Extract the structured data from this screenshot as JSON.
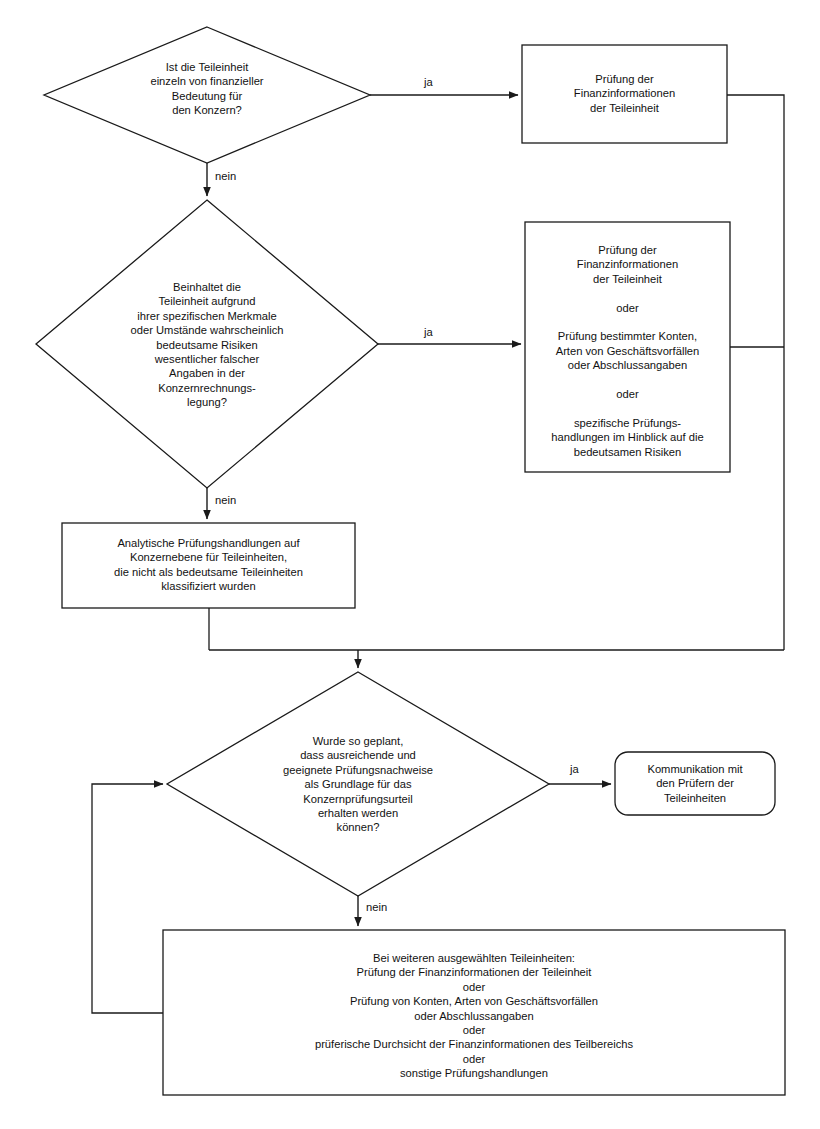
{
  "diagram": {
    "language": "de",
    "stroke_color": "#1a1a1a",
    "fill_color": "#ffffff",
    "text_color": "#121212"
  },
  "nodes": {
    "decision_1": {
      "type": "decision",
      "text": "Ist die Teileinheit\neinzeln von finanzieller\nBedeutung für\nden Konzern?"
    },
    "process_1": {
      "type": "process",
      "text": "Prüfung der\nFinanzinformationen\nder Teileinheit"
    },
    "decision_2": {
      "type": "decision",
      "text": "Beinhaltet die\nTeileinheit aufgrund\nihrer spezifischen Merkmale\noder Umstände wahrscheinlich\nbedeutsame Risiken\nwesentlicher falscher\nAngaben in der\nKonzernrechnungs-\nlegung?"
    },
    "process_2": {
      "type": "process",
      "text": "Prüfung der\nFinanzinformationen\nder Teileinheit\n\noder\n\nPrüfung bestimmter Konten,\nArten von Geschäftsvorfällen\noder Abschlussangaben\n\noder\n\nspezifische Prüfungs-\nhandlungen im Hinblick auf die\nbedeutsamen Risiken"
    },
    "process_3": {
      "type": "process",
      "text": "Analytische Prüfungshandlungen auf\nKonzernebene für Teileinheiten,\ndie nicht als bedeutsame Teileinheiten\nklassifiziert wurden"
    },
    "decision_3": {
      "type": "decision",
      "text": "Wurde so geplant,\ndass ausreichende und\ngeeignete Prüfungsnachweise\nals Grundlage für das\nKonzernprüfungsurteil\nerhalten werden\nkönnen?"
    },
    "process_4": {
      "type": "rounded-process",
      "text": "Kommunikation mit\nden Prüfern der\nTeileinheiten"
    },
    "process_5": {
      "type": "process",
      "text": "Bei weiteren ausgewählten Teileinheiten:\nPrüfung der Finanzinformationen der Teileinheit\noder\nPrüfung von Konten, Arten von Geschäftsvorfällen\noder Abschlussangaben\noder\nprüferische Durchsicht der Finanzinformationen des Teilbereichs\noder\nsonstige Prüfungshandlungen"
    }
  },
  "edge_labels": {
    "d1_yes": "ja",
    "d1_no": "nein",
    "d2_yes": "ja",
    "d2_no": "nein",
    "d3_yes": "ja",
    "d3_no": "nein"
  }
}
